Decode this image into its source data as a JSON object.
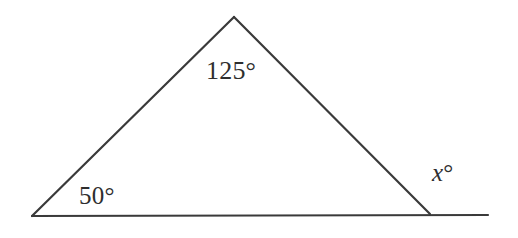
{
  "figure": {
    "stroke_color": "#3a3a3a",
    "background_color": "#ffffff",
    "text_color": "#2e2e2e",
    "labels": {
      "apex_angle": "125°",
      "base_left_angle": "50°",
      "exterior_angle_variable": "x",
      "degree_symbol": "°"
    },
    "geometry": {
      "vertex_left": {
        "x": 32,
        "y": 216
      },
      "vertex_apex": {
        "x": 234,
        "y": 17
      },
      "vertex_right": {
        "x": 430,
        "y": 214
      },
      "base_line_end": {
        "x": 488,
        "y": 215
      },
      "stroke_width": 2.2
    }
  }
}
